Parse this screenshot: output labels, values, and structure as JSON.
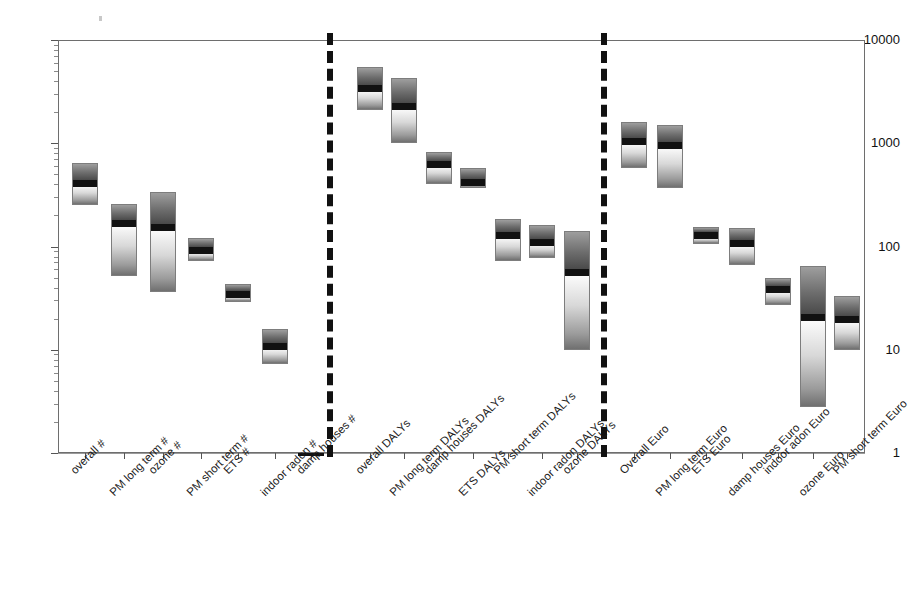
{
  "chart_data": {
    "type": "bar",
    "subtype": "range-bars-with-median",
    "title": "",
    "subtitle": "",
    "xlabel": "",
    "ylabel": "",
    "yscale": "log",
    "ylim": [
      1,
      10000
    ],
    "ytick_labels": [
      "10000",
      "1000",
      "100",
      "10",
      "1"
    ],
    "ytick_values": [
      10000,
      1000,
      100,
      10,
      1
    ],
    "grid": true,
    "legend": false,
    "group_separators": [
      "dashed-vertical",
      "dashed-vertical"
    ],
    "groups": [
      {
        "name": "# (cases / attributable burden counts)",
        "categories": [
          "overall #",
          "PM long term #",
          "ozone #",
          "PM short term #",
          "ETS #",
          "indoor radon #",
          "damp houses #"
        ],
        "values": [
          {
            "label": "overall #",
            "low": 250,
            "median": 420,
            "high": 640
          },
          {
            "label": "PM long term #",
            "low": 52,
            "median": 170,
            "high": 260
          },
          {
            "label": "ozone #",
            "low": 36,
            "median": 155,
            "high": 340
          },
          {
            "label": "PM short term #",
            "low": 72,
            "median": 93,
            "high": 120
          },
          {
            "label": "ETS #",
            "low": 29,
            "median": 35,
            "high": 43
          },
          {
            "label": "indoor radon #",
            "low": 7.3,
            "median": 11,
            "high": 16
          },
          {
            "label": "damp houses #",
            "low": 1,
            "median": 1,
            "high": 1
          }
        ]
      },
      {
        "name": "DALYs",
        "categories": [
          "overall DALYs",
          "PM long term DALYs",
          "damp houses DALYs",
          "ETS DALYs",
          "PM short term DALYs",
          "indoor radon DALYs",
          "ozone DALYs"
        ],
        "values": [
          {
            "label": "overall DALYs",
            "low": 2100,
            "median": 3500,
            "high": 5500
          },
          {
            "label": "PM long term DALYs",
            "low": 1000,
            "median": 2300,
            "high": 4300
          },
          {
            "label": "damp houses DALYs",
            "low": 400,
            "median": 640,
            "high": 830
          },
          {
            "label": "ETS DALYs",
            "low": 370,
            "median": 430,
            "high": 580
          },
          {
            "label": "PM short term DALYs",
            "low": 73,
            "median": 130,
            "high": 185
          },
          {
            "label": "indoor radon DALYs",
            "low": 78,
            "median": 112,
            "high": 160
          },
          {
            "label": "ozone DALYs",
            "low": 10,
            "median": 57,
            "high": 140
          }
        ]
      },
      {
        "name": "Euro",
        "categories": [
          "Overall Euro",
          "PM long term Euro",
          "ETS Euro",
          "damp houses Euro",
          "indoor adon Euro",
          "ozone Euro",
          "PM short term Euro"
        ],
        "values": [
          {
            "label": "Overall Euro",
            "low": 580,
            "median": 1060,
            "high": 1600
          },
          {
            "label": "PM long term Euro",
            "low": 370,
            "median": 980,
            "high": 1500
          },
          {
            "label": "ETS Euro",
            "low": 105,
            "median": 130,
            "high": 155
          },
          {
            "label": "damp houses Euro",
            "low": 66,
            "median": 110,
            "high": 150
          },
          {
            "label": "indoor adon Euro",
            "low": 27,
            "median": 39,
            "high": 50
          },
          {
            "label": "ozone Euro",
            "low": 2.8,
            "median": 21,
            "high": 65
          },
          {
            "label": "PM short term Euro",
            "low": 10,
            "median": 20,
            "high": 33
          }
        ]
      }
    ]
  },
  "axis": {
    "y_labels": [
      "10000",
      "1000",
      "100",
      "10",
      "1"
    ]
  }
}
